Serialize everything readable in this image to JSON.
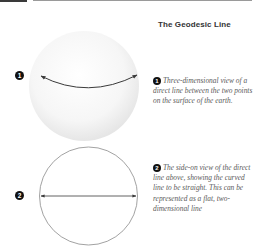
{
  "title": "The Geodesic Line",
  "figures": [
    {
      "marker": "1",
      "kind": "sphere",
      "description": "Three-dimensional view of a direct line between the two points on the surface of the earth."
    },
    {
      "marker": "2",
      "kind": "circle",
      "description": "The side-on view of the direct line above, showing the curved line to be straight. This can be represented as a flat, two-dimensional line"
    }
  ],
  "colors": {
    "line": "#3a3a3a",
    "circle_outline": "#8a8a8a",
    "sphere_shade": "#ebebeb",
    "text": "#5a5a5a",
    "marker_fill": "#111111"
  }
}
